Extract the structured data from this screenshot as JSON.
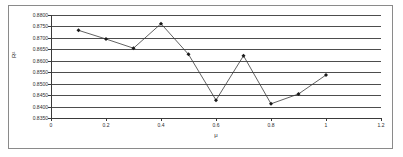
{
  "chart_data": {
    "type": "line",
    "title": "",
    "xlabel": "μ",
    "ylabel": "R²",
    "xlim": [
      0,
      1.2
    ],
    "ylim": [
      0.835,
      0.88
    ],
    "grid": true,
    "legend": false,
    "x_ticks": [
      "0",
      "0.2",
      "0.4",
      "0.6",
      "0.8",
      "1",
      "1.2"
    ],
    "x_tick_values": [
      0,
      0.2,
      0.4,
      0.6,
      0.8,
      1.0,
      1.2
    ],
    "y_ticks": [
      "0.8800",
      "0.8750",
      "0.8700",
      "0.8650",
      "0.8600",
      "0.8550",
      "0.8500",
      "0.8450",
      "0.8400",
      "0.8350"
    ],
    "y_tick_values": [
      0.88,
      0.875,
      0.87,
      0.865,
      0.86,
      0.855,
      0.85,
      0.845,
      0.84,
      0.835
    ],
    "x": [
      0.1,
      0.2,
      0.3,
      0.4,
      0.5,
      0.6,
      0.7,
      0.8,
      0.9,
      1.0
    ],
    "values": [
      0.8733,
      0.8695,
      0.8655,
      0.8762,
      0.8628,
      0.8428,
      0.8622,
      0.8412,
      0.8455,
      0.8538
    ],
    "series": [
      {
        "name": "R²",
        "marker": "diamond",
        "color": "#1a1a1a",
        "line_color": "#3a3a3a",
        "values": [
          0.8733,
          0.8695,
          0.8655,
          0.8762,
          0.8628,
          0.8428,
          0.8622,
          0.8412,
          0.8455,
          0.8538
        ]
      }
    ]
  },
  "colors": {
    "grid": "#4d4d4d",
    "axis": "#3a3a3a",
    "border": "#8a8a8a",
    "text": "#2b2b2b",
    "background": "#ffffff"
  }
}
